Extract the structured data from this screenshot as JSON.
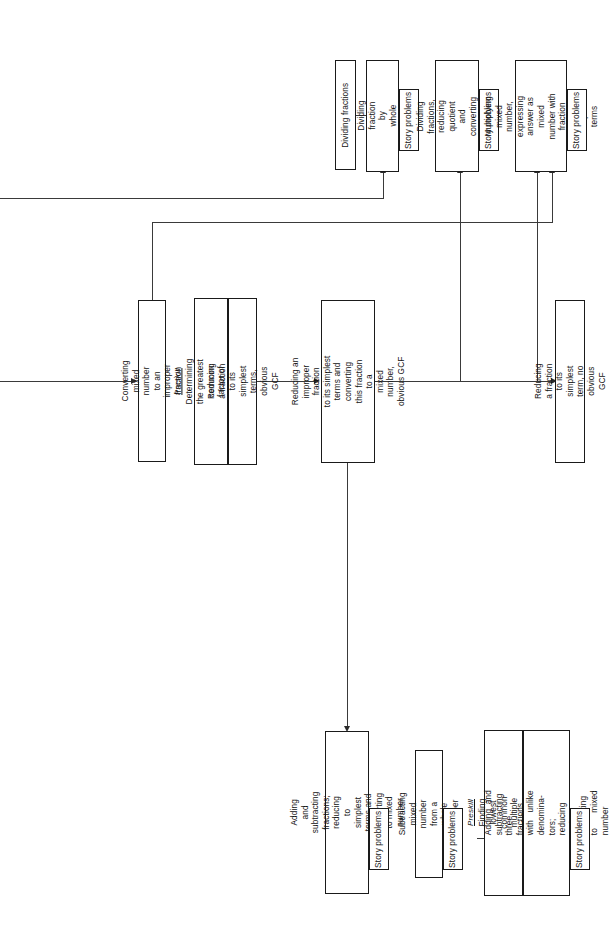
{
  "diagram": {
    "orientation": "rotated-90-ccw",
    "preskill_label": "Preskill",
    "story_label": "Story problems",
    "nodes": {
      "dividing_fractions": "Dividing fractions",
      "dividing_fraction_by_whole": "Dividing fraction by\nwhole number",
      "dividing_fractions_reducing": "Dividing fractions,\nreducing quotient and\nconverting to mixed number",
      "multiplying_mixed_number": "Multiplying mixed number,\nexpressing answer as\nmixed number with fraction\nwritten in simplest terms",
      "converting_mixed_number": "Converting mixed number\nto an improper fraction",
      "preskill_gcf": "Determining the greatest\ncommon factor of two numbers",
      "reducing_obvious_gcf": "Reducing a fraction to its\nsimplest terms, obvious GCF",
      "reducing_improper": "Reducing an improper fraction\nto its simplest terms and\nconverting this fraction to a\nmixed number, obvious GCF",
      "reducing_no_gcf": "Reducing a fraction to its\nsimplest term, no obvious GCF",
      "adding_subtracting": "Adding and subtracting\nfractions; reducing to\nsimplest terms and converting\nto mixed number",
      "subtracting_mixed": "Subtracting mixed number\nfrom a whole number",
      "preskill_lcm": "Finding lowest common\nmultiple of three numbers",
      "adding_subtracting_three": "Adding and subtracting three\nfractions  with  unlike  denomina-\ntors; reducing and converting\nto mixed number"
    },
    "story_boxes": [
      "Story problems",
      "Story problems",
      "Story problems",
      "Story problems",
      "Story problems",
      "Story problems"
    ],
    "colors": {
      "stroke": "#1a1a1a",
      "connector": "#3a3a3a",
      "background": "#ffffff"
    }
  }
}
